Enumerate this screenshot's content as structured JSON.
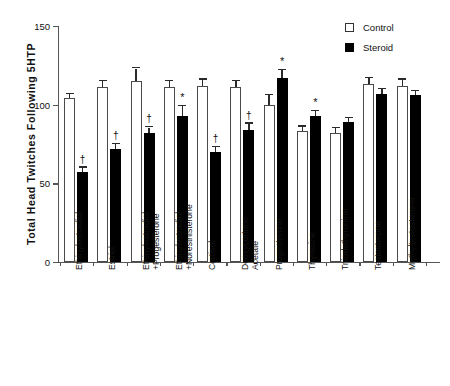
{
  "chart_data": {
    "type": "bar",
    "title": "",
    "xlabel": "",
    "ylabel": "Total  Head  Twitches  Following  5HTP",
    "ylim": [
      0,
      150
    ],
    "yticks": [
      0,
      50,
      100,
      150
    ],
    "ytick_labels": [
      "0",
      "50",
      "100",
      "150"
    ],
    "grid": false,
    "legend_position": "top-right",
    "categories": [
      "Ethinylestradiol",
      "Estriol",
      "Ethinylestradiol\n+Progesterone",
      "Ethinylestradiol\n+Noresthisterone",
      "Cortisol",
      "Deoxycortone\nAcetate",
      "Progesterone",
      "Thyroxine",
      "Triiodothyronine",
      "Testosterone",
      "Methyltestosterone"
    ],
    "series": [
      {
        "name": "Control",
        "color": "#ffffff",
        "values": [
          104,
          111,
          115,
          111,
          112,
          111,
          100,
          83,
          82,
          113,
          112
        ],
        "errors": [
          2.5,
          4,
          8,
          4,
          4,
          4,
          6,
          3,
          3,
          4,
          4
        ],
        "significance": [
          "",
          "",
          "",
          "",
          "",
          "",
          "",
          "",
          "",
          "",
          ""
        ]
      },
      {
        "name": "Steroid",
        "color": "#000000",
        "values": [
          57,
          72,
          82,
          93,
          70,
          84,
          117,
          93,
          89,
          107,
          106
        ],
        "errors": [
          3,
          3,
          3.5,
          6,
          3,
          4,
          5,
          3,
          2.5,
          3,
          2.5
        ],
        "significance": [
          "†",
          "†",
          "†",
          "*",
          "†",
          "†",
          "*",
          "*",
          "",
          "",
          ""
        ]
      }
    ]
  },
  "legend": {
    "items": [
      {
        "label": "Control",
        "style": "open"
      },
      {
        "label": "Steroid",
        "style": "filled"
      }
    ]
  }
}
